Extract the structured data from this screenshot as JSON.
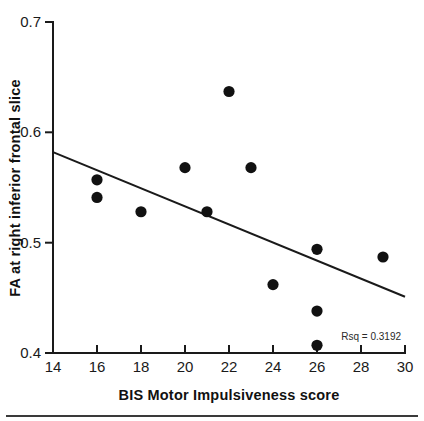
{
  "chart_data": {
    "type": "scatter",
    "title": "",
    "xlabel": "BIS Motor Impulsiveness score",
    "ylabel": "FA at right inferior frontal slice",
    "xlim": [
      14,
      30
    ],
    "ylim": [
      0.4,
      0.7
    ],
    "xticks": [
      14,
      16,
      18,
      20,
      22,
      24,
      26,
      28,
      30
    ],
    "xtick_labels": [
      "14",
      "16",
      "18",
      "20",
      "22",
      "24",
      "26",
      "28",
      "30"
    ],
    "yticks": [
      0.4,
      0.5,
      0.6,
      0.7
    ],
    "ytick_labels": [
      "0.4",
      "0.5",
      "0.6",
      "0.7"
    ],
    "grid": false,
    "legend": false,
    "points": [
      {
        "x": 16,
        "y": 0.557
      },
      {
        "x": 16,
        "y": 0.541
      },
      {
        "x": 18,
        "y": 0.528
      },
      {
        "x": 20,
        "y": 0.568
      },
      {
        "x": 21,
        "y": 0.528
      },
      {
        "x": 22,
        "y": 0.637
      },
      {
        "x": 23,
        "y": 0.568
      },
      {
        "x": 24,
        "y": 0.462
      },
      {
        "x": 26,
        "y": 0.494
      },
      {
        "x": 26,
        "y": 0.438
      },
      {
        "x": 26,
        "y": 0.407
      },
      {
        "x": 29,
        "y": 0.487
      }
    ],
    "fit_line": {
      "x_start": 14,
      "y_start": 0.582,
      "x_end": 30,
      "y_end": 0.451
    },
    "annotation": "Rsq = 0.3192",
    "marker_color": "#111111",
    "line_color": "#1a1a1a",
    "axis_color": "#1a1a1a"
  }
}
